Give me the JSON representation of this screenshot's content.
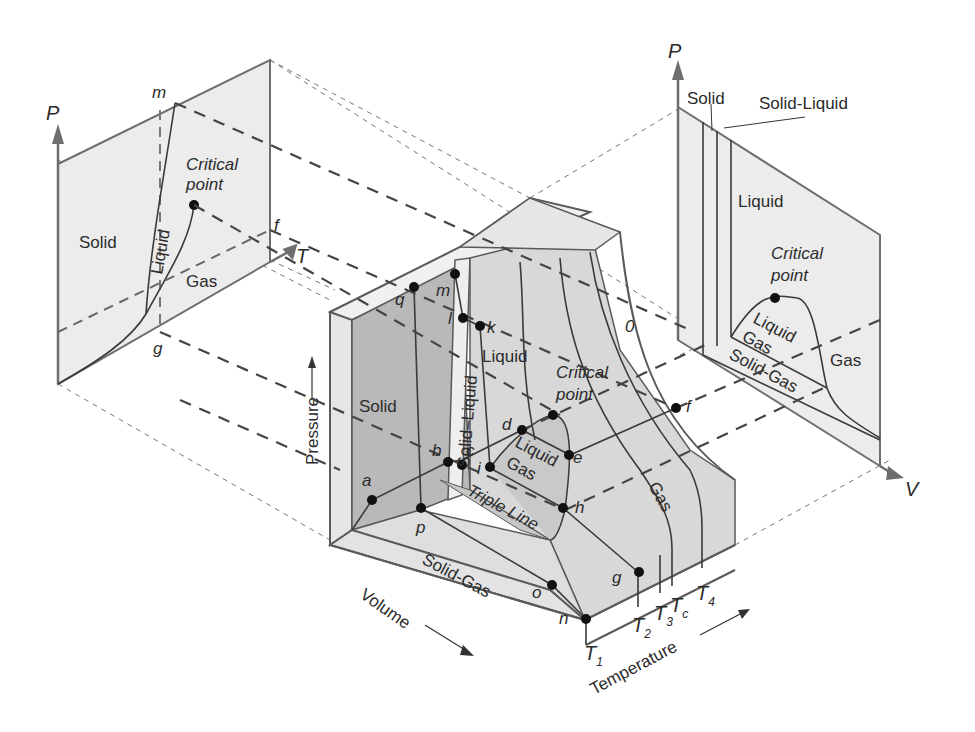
{
  "figure": {
    "colors": {
      "panel_fill": "#ececec",
      "surface_light": "#e6e6e6",
      "surface_mid": "#d4d4d4",
      "surface_dark": "#b9b9b9",
      "line": "#333333",
      "axis": "#6e6e6e"
    }
  },
  "pt_diagram": {
    "p_axis": "P",
    "t_axis": "T",
    "regions": {
      "solid": "Solid",
      "liquid": "Liquid",
      "gas": "Gas"
    },
    "critical_point": {
      "line1": "Critical",
      "line2": "point"
    },
    "point_labels": {
      "m": "m",
      "f": "f",
      "g": "g"
    }
  },
  "pv_diagram": {
    "p_axis": "P",
    "v_axis": "V",
    "regions": {
      "solid": "Solid",
      "solid_liquid": "Solid-Liquid",
      "liquid": "Liquid",
      "liquid_gas_1": "Liquid",
      "liquid_gas_2": "Gas",
      "gas": "Gas",
      "solid_gas": "Solid-Gas"
    },
    "critical_point": {
      "line1": "Critical",
      "line2": "point"
    },
    "point_labels": {
      "o": "0"
    }
  },
  "surface": {
    "axes": {
      "pressure": "Pressure",
      "volume": "Volume",
      "temperature": "Temperature"
    },
    "regions": {
      "solid": "Solid",
      "solid_liquid": "Solid–Liquid",
      "liquid": "Liquid",
      "liquid_gas_1": "Liquid",
      "liquid_gas_2": "Gas",
      "triple_line": "Triple Line",
      "gas": "Gas",
      "solid_gas": "Solid-Gas"
    },
    "critical_point": {
      "line1": "Critical",
      "line2": "point"
    },
    "isotherms": [
      {
        "base": "T",
        "sub": "1"
      },
      {
        "base": "T",
        "sub": "2"
      },
      {
        "base": "T",
        "sub": "3"
      },
      {
        "base": "T",
        "sub": "c"
      },
      {
        "base": "T",
        "sub": "4"
      }
    ],
    "points": [
      "a",
      "b",
      "c",
      "d",
      "e",
      "f",
      "g",
      "h",
      "i",
      "k",
      "l",
      "m",
      "n",
      "o",
      "p",
      "q"
    ]
  }
}
